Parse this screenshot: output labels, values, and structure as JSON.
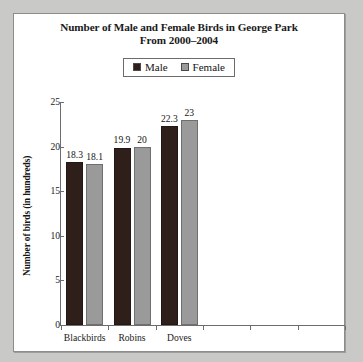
{
  "title": {
    "line1": "Number of Male and Female Birds in George Park",
    "line2": "From 2000–2004"
  },
  "legend": {
    "entries": [
      {
        "label": "Male",
        "color": "#2e1f1a"
      },
      {
        "label": "Female",
        "color": "#9a9a9a"
      }
    ]
  },
  "axes": {
    "ylabel": "Number of birds (in hundreds)",
    "yticks": [
      "25",
      "20",
      "15",
      "10",
      "5",
      "0"
    ]
  },
  "chart_data": {
    "type": "bar",
    "title": "Number of Male and Female Birds in George Park From 2000–2004",
    "xlabel": "",
    "ylabel": "Number of birds (in hundreds)",
    "ylim": [
      0,
      25
    ],
    "ytick_step": 5,
    "grid": false,
    "legend_position": "top-center",
    "categories": [
      "Blackbirds",
      "Robins",
      "Doves"
    ],
    "series": [
      {
        "name": "Male",
        "color": "#2e1f1a",
        "values": [
          18.3,
          19.9,
          22.3
        ],
        "labels": [
          "18.3",
          "19.9",
          "22.3"
        ]
      },
      {
        "name": "Female",
        "color": "#9a9a9a",
        "values": [
          18.1,
          20,
          23
        ],
        "labels": [
          "18.1",
          "20",
          "23"
        ]
      }
    ],
    "empty_tick_slots": 3
  }
}
